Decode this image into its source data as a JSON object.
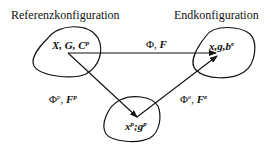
{
  "diagram": {
    "type": "configuration-mapping",
    "titles": {
      "reference": "Referenzkonfiguration",
      "final": "Endkonfiguration"
    },
    "nodes": {
      "reference": {
        "main": "X, G, C",
        "sup": "p"
      },
      "final": {
        "main": "x,g,b",
        "sup": "e"
      },
      "intermediate": {
        "x": "x",
        "x_sup": "p",
        "sep": ";",
        "g": "g",
        "g_sup": "p"
      }
    },
    "edges": {
      "total": {
        "phi": "Φ",
        "sep": ", ",
        "F": "F"
      },
      "plastic": {
        "phi": "Φ",
        "phi_sup": "p",
        "sep": ", ",
        "F": "F",
        "F_sup": "p"
      },
      "elastic": {
        "phi": "Φ",
        "phi_sup": "e",
        "sep": ", ",
        "F": "F",
        "F_sup": "e"
      }
    },
    "colors": {
      "stroke": "#111111",
      "background": "#ffffff"
    }
  }
}
